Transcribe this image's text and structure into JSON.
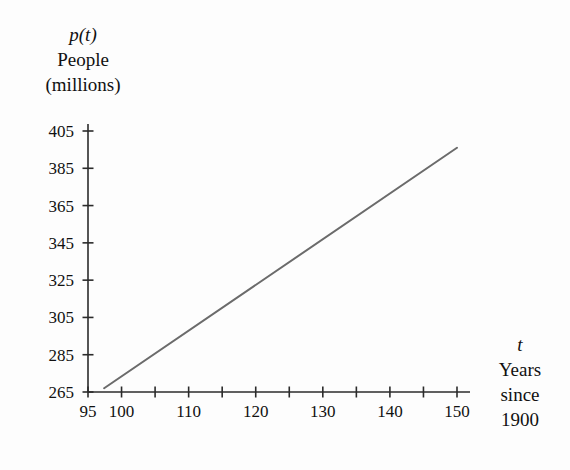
{
  "chart_data": {
    "type": "line",
    "title": "",
    "subtitle": "",
    "xlabel": "t Years since 1900",
    "ylabel": "p(t) People (millions)",
    "xlabel_lines": [
      "t",
      "Years",
      "since",
      "1900"
    ],
    "ylabel_lines": [
      "p(t)",
      "People",
      "(millions)"
    ],
    "grid": false,
    "legend": null,
    "xlim": [
      95,
      152
    ],
    "ylim": [
      265,
      412
    ],
    "xticks": [
      95,
      100,
      105,
      110,
      115,
      120,
      125,
      130,
      135,
      140,
      145,
      150
    ],
    "xticklabels": [
      "95",
      "100",
      "",
      "110",
      "",
      "120",
      "",
      "130",
      "",
      "140",
      "",
      "150"
    ],
    "yticks": [
      265,
      285,
      305,
      325,
      345,
      365,
      385,
      405
    ],
    "yticklabels": [
      "265",
      "285",
      "305",
      "325",
      "345",
      "365",
      "385",
      "405"
    ],
    "series": [
      {
        "name": "p(t)",
        "color": "#6b6b6b",
        "linewidth": 2,
        "x": [
          97.4,
          150.0
        ],
        "y": [
          267,
          396
        ]
      }
    ],
    "annotations": []
  },
  "axis_labels": {
    "y_line1": "p(t)",
    "y_line2": "People",
    "y_line3": "(millions)",
    "x_line1": "t",
    "x_line2": "Years",
    "x_line3": "since",
    "x_line4": "1900"
  },
  "colors": {
    "background": "#fdfdfd",
    "axis": "#2b2b2b",
    "line": "#6b6b6b",
    "text": "#111111"
  }
}
